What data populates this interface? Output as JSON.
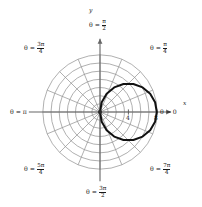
{
  "figure": {
    "kind": "polar-plot",
    "background": "#ffffff",
    "curve_color": "#111111",
    "grid_color": "#8e8e8e",
    "axis_color": "#666666"
  },
  "axes": {
    "x_label": "x",
    "y_label": "y",
    "origin_px": {
      "x": 100,
      "y": 112
    },
    "pixels_per_unit": 7.1
  },
  "angle_labels": [
    {
      "name": "theta-0",
      "text": "θ = 0",
      "prefix": "θ =",
      "num": "",
      "den": "",
      "whole": "0",
      "angle_deg": 0,
      "left": 160,
      "top": 109
    },
    {
      "name": "theta-pi-4",
      "text": "θ = π/4",
      "prefix": "θ =",
      "num": "π",
      "den": "4",
      "whole": "",
      "angle_deg": 45,
      "left": 150,
      "top": 42
    },
    {
      "name": "theta-pi-2",
      "text": "θ = π/2",
      "prefix": "θ =",
      "num": "π",
      "den": "2",
      "whole": "",
      "angle_deg": 90,
      "left": 89,
      "top": 19
    },
    {
      "name": "theta-3pi-4",
      "text": "θ = 3π/4",
      "prefix": "θ =",
      "num": "3π",
      "den": "4",
      "whole": "",
      "angle_deg": 135,
      "left": 24,
      "top": 42
    },
    {
      "name": "theta-pi",
      "text": "θ = π",
      "prefix": "θ =",
      "num": "",
      "den": "",
      "whole": "π",
      "angle_deg": 180,
      "left": 10,
      "top": 109
    },
    {
      "name": "theta-5pi-4",
      "text": "θ = 5π/4",
      "prefix": "θ =",
      "num": "5π",
      "den": "4",
      "whole": "",
      "angle_deg": 225,
      "left": 24,
      "top": 163
    },
    {
      "name": "theta-3pi-2",
      "text": "θ = 3π/2",
      "prefix": "θ =",
      "num": "3π",
      "den": "2",
      "whole": "",
      "angle_deg": 270,
      "left": 86,
      "top": 186
    },
    {
      "name": "theta-7pi-4",
      "text": "θ = 7π/4",
      "prefix": "θ =",
      "num": "7π",
      "den": "4",
      "whole": "",
      "angle_deg": 315,
      "left": 150,
      "top": 163
    }
  ],
  "radial_ticks": [
    {
      "value": "4",
      "left": 126,
      "top": 114
    },
    {
      "value": "8",
      "left": 154,
      "top": 114
    }
  ],
  "chart_data": {
    "type": "line",
    "coordinate_system": "polar",
    "title": "",
    "xlabel": "x",
    "ylabel": "y",
    "equation": "r = 8 cos(θ)",
    "r_max": 8,
    "grid": {
      "enabled": true,
      "circle_count": 7,
      "circle_radii": [
        1.15,
        2.3,
        3.45,
        4.6,
        5.75,
        6.9,
        8.05
      ],
      "spoke_count": 16,
      "spoke_step_deg": 22.5
    },
    "angle_tick_labels": [
      "0",
      "π/4",
      "π/2",
      "3π/4",
      "π",
      "5π/4",
      "3π/2",
      "7π/4"
    ],
    "radial_tick_labels": [
      "4",
      "8"
    ],
    "theta_deg": [
      0,
      10,
      20,
      30,
      40,
      50,
      60,
      70,
      80,
      90,
      100,
      110,
      120,
      130,
      140,
      150,
      160,
      170,
      180,
      190,
      200,
      210,
      220,
      230,
      240,
      250,
      260,
      270,
      280,
      290,
      300,
      310,
      320,
      330,
      340,
      350,
      360
    ],
    "r": [
      8.0,
      7.88,
      7.52,
      6.93,
      6.13,
      5.14,
      4.0,
      2.74,
      1.39,
      0.0,
      -1.39,
      -2.74,
      -4.0,
      -5.14,
      -6.13,
      -6.93,
      -7.52,
      -7.88,
      -8.0,
      -7.88,
      -7.52,
      -6.93,
      -6.13,
      -5.14,
      -4.0,
      -2.74,
      -1.39,
      0.0,
      1.39,
      2.74,
      4.0,
      5.14,
      6.13,
      6.93,
      7.52,
      7.88,
      8.0
    ],
    "legend": {
      "entries": [],
      "position": "none"
    }
  }
}
